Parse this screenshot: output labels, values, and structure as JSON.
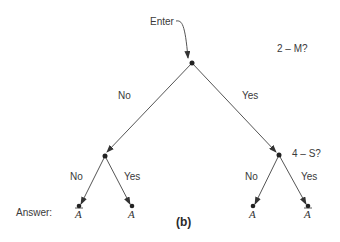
{
  "diagram": {
    "caption": "(b)",
    "entry_label": "Enter",
    "answer_label": "Answer:",
    "colors": {
      "line": "#555555",
      "node": "#222222",
      "text": "#3a3a3a"
    },
    "nodes": {
      "root": {
        "question": "2 – M?"
      },
      "left": {
        "question": ""
      },
      "right": {
        "question": "4 – S?"
      }
    },
    "edges": {
      "root_left": "No",
      "root_right": "Yes",
      "left_left": "No",
      "left_right": "Yes",
      "right_left": "No",
      "right_right": "Yes"
    },
    "leaves": [
      {
        "value": "A",
        "negated": true
      },
      {
        "value": "A",
        "negated": false
      },
      {
        "value": "A",
        "negated": false
      },
      {
        "value": "A",
        "negated": true
      }
    ]
  }
}
